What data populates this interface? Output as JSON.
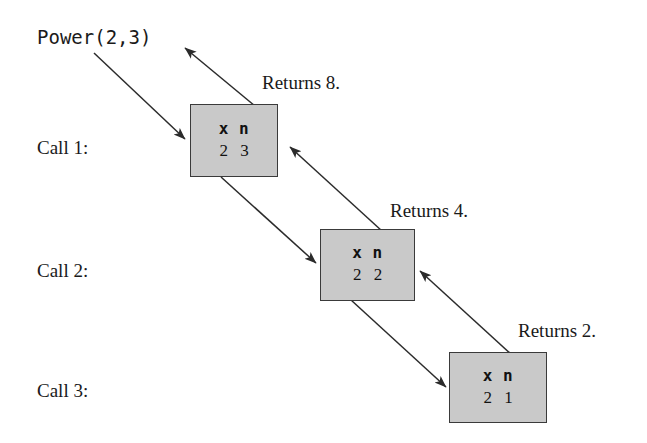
{
  "diagram": {
    "invocation": {
      "text": "Power(2,3)"
    },
    "stroke_color": "#2b2b2b",
    "box_fill_color": "#c9c9c9",
    "box_border_color": "#3a3a3a",
    "text_color": "#1a1a1a",
    "background_color": "#ffffff",
    "var_header": "x  n",
    "calls": [
      {
        "call_label": "Call 1:",
        "returns_label": "Returns 8.",
        "vars": "x  n",
        "values": "2  3",
        "x": 2,
        "n": 3,
        "return_value": 8
      },
      {
        "call_label": "Call 2:",
        "returns_label": "Returns 4.",
        "vars": "x  n",
        "values": "2  2",
        "x": 2,
        "n": 2,
        "return_value": 4
      },
      {
        "call_label": "Call 3:",
        "returns_label": "Returns 2.",
        "vars": "x  n",
        "values": "2  1",
        "x": 2,
        "n": 1,
        "return_value": 2
      }
    ]
  }
}
